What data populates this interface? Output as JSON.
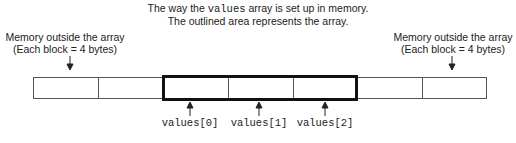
{
  "title": {
    "line1_pre": "The way the ",
    "line1_code": "values",
    "line1_post": " array is set up in memory.",
    "line2": "The outlined area represents the array."
  },
  "left_note": {
    "line1": "Memory outside the array",
    "line2": "(Each block = 4 bytes)"
  },
  "right_note": {
    "line1": "Memory outside the array",
    "line2": "(Each block = 4 bytes)"
  },
  "elements": [
    {
      "label": "values[0]"
    },
    {
      "label": "values[1]"
    },
    {
      "label": "values[2]"
    }
  ]
}
